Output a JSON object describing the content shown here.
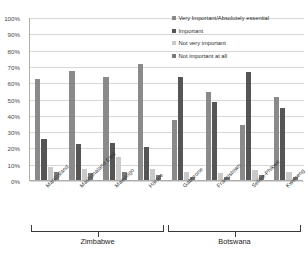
{
  "chart_data": {
    "type": "bar",
    "title": "",
    "xlabel": "",
    "ylabel": "",
    "ylim": [
      0,
      100
    ],
    "grid": true,
    "legend_position": "top-right",
    "categories": [
      "Manicaland",
      "Mashonaland East",
      "Masvingo",
      "Harare",
      "Gaborone",
      "Francistown",
      "Selibe-Phikwe",
      "Kweneng"
    ],
    "group_labels": [
      {
        "name": "Zimbabwe",
        "categories": [
          "Manicaland",
          "Mashonaland East",
          "Masvingo",
          "Harare"
        ]
      },
      {
        "name": "Botswana",
        "categories": [
          "Gaborone",
          "Francistown",
          "Selibe-Phikwe",
          "Kweneng"
        ]
      }
    ],
    "ytick_labels": [
      "0%",
      "10%",
      "20%",
      "30%",
      "40%",
      "50%",
      "60%",
      "70%",
      "80%",
      "90%",
      "100%"
    ],
    "ytick_values": [
      0,
      10,
      20,
      30,
      40,
      50,
      60,
      70,
      80,
      90,
      100
    ],
    "series": [
      {
        "name": "Very Important/Absolutely essential",
        "color": "#8a8a8a",
        "values": [
          62,
          67,
          63,
          71,
          37,
          54,
          34,
          51
        ]
      },
      {
        "name": "Important",
        "color": "#555555",
        "values": [
          25,
          22,
          23,
          20,
          63,
          48,
          66,
          44
        ]
      },
      {
        "name": "Not very important",
        "color": "#c9c9c9",
        "values": [
          8,
          7,
          14,
          7,
          5,
          4,
          6,
          5
        ]
      },
      {
        "name": "Not important at all",
        "color": "#7a7a7a",
        "values": [
          5,
          4,
          5,
          3,
          2,
          2,
          3,
          2
        ]
      }
    ]
  }
}
